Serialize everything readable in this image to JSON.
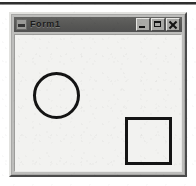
{
  "page": {
    "width": 196,
    "height": 186,
    "background_color": "#ffffff",
    "scan_artifact_top_rule": true
  },
  "window": {
    "title": "Form1",
    "icon": "form-app-icon",
    "frame_color": "#bdbdbb",
    "titlebar_color": "#575755",
    "client_background_color": "#f2f2f0",
    "bounds": {
      "x": 9,
      "y": 12,
      "width": 178,
      "height": 165
    },
    "controls": [
      {
        "name": "minimize",
        "label": "_",
        "glyph": "minimize-icon"
      },
      {
        "name": "maximize",
        "label": "□",
        "glyph": "maximize-icon"
      },
      {
        "name": "close",
        "label": "×",
        "glyph": "close-icon"
      }
    ]
  },
  "canvas": {
    "shapes": [
      {
        "type": "circle",
        "name": "circle-shape",
        "stroke_color": "#141414",
        "stroke_width": 3,
        "fill": "none",
        "bounds": {
          "x": 18,
          "y": 37,
          "width": 47,
          "height": 47
        }
      },
      {
        "type": "square",
        "name": "square-shape",
        "stroke_color": "#141414",
        "stroke_width": 3,
        "fill": "none",
        "bounds": {
          "x": 110,
          "y": 82,
          "width": 47,
          "height": 48
        }
      }
    ]
  }
}
